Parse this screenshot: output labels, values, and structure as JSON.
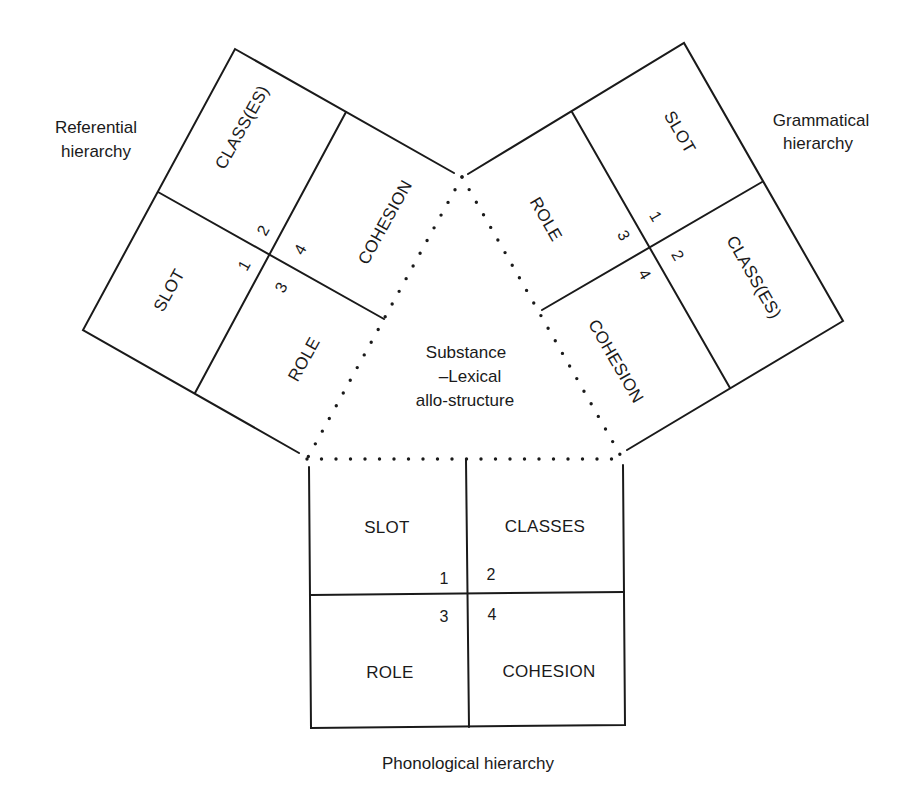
{
  "diagram": {
    "center": {
      "lines": [
        "Substance",
        "–Lexical",
        "allo-structure"
      ]
    },
    "referential": {
      "title_lines": [
        "Referential",
        "hierarchy"
      ],
      "cells": {
        "slot": "SLOT",
        "classes": "CLASS(ES)",
        "role": "ROLE",
        "cohesion": "COHESION"
      },
      "numbers": [
        "1",
        "2",
        "3",
        "4"
      ]
    },
    "grammatical": {
      "title_lines": [
        "Grammatical",
        "hierarchy"
      ],
      "cells": {
        "slot": "SLOT",
        "classes": "CLASS(ES)",
        "role": "ROLE",
        "cohesion": "COHESION"
      },
      "numbers": [
        "1",
        "2",
        "3",
        "4"
      ]
    },
    "phonological": {
      "title": "Phonological hierarchy",
      "cells": {
        "slot": "SLOT",
        "classes": "CLASSES",
        "role": "ROLE",
        "cohesion": "COHESION"
      },
      "numbers": [
        "1",
        "2",
        "3",
        "4"
      ]
    },
    "colors": {
      "ink": "#1a1a1a",
      "paper": "#ffffff"
    }
  }
}
